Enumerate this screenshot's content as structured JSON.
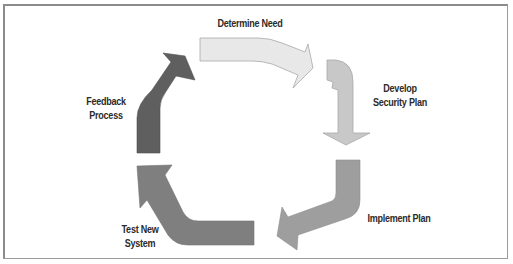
{
  "diagram": {
    "type": "cycle",
    "steps": [
      {
        "id": "determine-need",
        "label_lines": [
          "Determine Need"
        ],
        "color": "#e6e6e6"
      },
      {
        "id": "develop-security-plan",
        "label_lines": [
          "Develop",
          "Security Plan"
        ],
        "color": "#c4c4c4"
      },
      {
        "id": "implement-plan",
        "label_lines": [
          "Implement Plan"
        ],
        "color": "#9b9b9b"
      },
      {
        "id": "test-new-system",
        "label_lines": [
          "Test New",
          "System"
        ],
        "color": "#7c7c7c"
      },
      {
        "id": "feedback-process",
        "label_lines": [
          "Feedback",
          "Process"
        ],
        "color": "#5e5e5e"
      }
    ],
    "edge_color": "#8a8a8a",
    "frame_color": "#9a9a9a"
  }
}
